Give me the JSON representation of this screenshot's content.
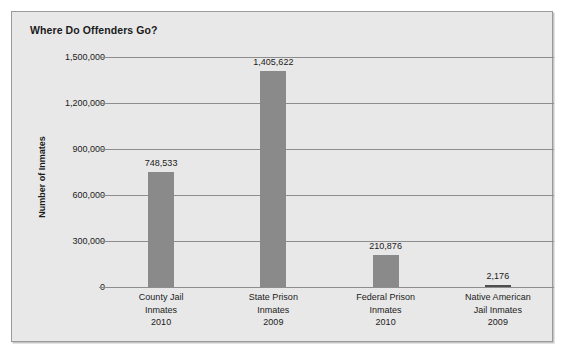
{
  "chart_data": {
    "type": "bar",
    "title": "Where Do Offenders Go?",
    "xlabel": "",
    "ylabel": "Number of Inmates",
    "categories": [
      "County Jail Inmates 2010",
      "State Prison Inmates 2009",
      "Federal Prison Inmates 2010",
      "Native American Jail Inmates 2009"
    ],
    "category_lines": [
      [
        "County Jail",
        "Inmates",
        "2010"
      ],
      [
        "State Prison",
        "Inmates",
        "2009"
      ],
      [
        "Federal Prison",
        "Inmates",
        "2010"
      ],
      [
        "Native American",
        "Jail Inmates",
        "2009"
      ]
    ],
    "values": [
      748533,
      1405622,
      210876,
      2176
    ],
    "value_labels": [
      "748,533",
      "1,405,622",
      "210,876",
      "2,176"
    ],
    "ylim": [
      0,
      1500000
    ],
    "yticks": [
      0,
      300000,
      600000,
      900000,
      1200000,
      1500000
    ],
    "ytick_labels": [
      "0",
      "300,000",
      "600,000",
      "900,000",
      "1,200,000",
      "1,500,000"
    ],
    "grid": true,
    "legend": "none",
    "bar_color": "#8a8a8a",
    "bar_color_small": "#4e4e4e",
    "plot_background": "#e8e8e8",
    "gridline_color": "#8d8d8d",
    "text_color": "#1b1b1b"
  }
}
